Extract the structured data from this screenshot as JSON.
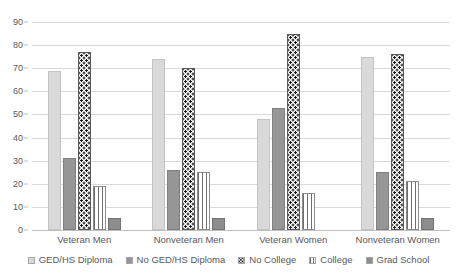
{
  "chart_data": {
    "type": "bar",
    "title": "",
    "subtitle": "",
    "xlabel": "",
    "ylabel": "",
    "ylim": [
      0,
      90
    ],
    "ytick_step": 10,
    "yticks": [
      0,
      10,
      20,
      30,
      40,
      50,
      60,
      70,
      80,
      90
    ],
    "grid": true,
    "legend_position": "bottom",
    "categories": [
      "Veteran Men",
      "Nonveteran Men",
      "Veteran Women",
      "Nonveteran Women"
    ],
    "series": [
      {
        "name": "GED/HS Diploma",
        "values": [
          69,
          74,
          48,
          75
        ],
        "color": "#d9d9d9",
        "pattern": "solid"
      },
      {
        "name": "No GED/HS Diploma",
        "values": [
          31,
          26,
          53,
          25
        ],
        "color": "#969696",
        "pattern": "solid"
      },
      {
        "name": "No College",
        "values": [
          77,
          70,
          85,
          76
        ],
        "color": "#1a1a1a",
        "pattern": "dotted"
      },
      {
        "name": "College",
        "values": [
          19,
          25,
          16,
          21
        ],
        "color": "#6e6e6e",
        "pattern": "vertical-stripes"
      },
      {
        "name": "Grad School",
        "values": [
          5,
          5,
          0,
          5
        ],
        "color": "#8c8c8c",
        "pattern": "solid"
      }
    ]
  },
  "axis": {
    "y_tick_labels": [
      "90",
      "80",
      "70",
      "60",
      "50",
      "40",
      "30",
      "20",
      "10",
      "0"
    ],
    "x_tick_labels": [
      "Veteran Men",
      "Nonveteran Men",
      "Veteran Women",
      "Nonveteran Women"
    ]
  },
  "legend": {
    "items": [
      {
        "label": "GED/HS Diploma"
      },
      {
        "label": "No GED/HS Diploma"
      },
      {
        "label": "No College"
      },
      {
        "label": "College"
      },
      {
        "label": "Grad School"
      }
    ]
  }
}
